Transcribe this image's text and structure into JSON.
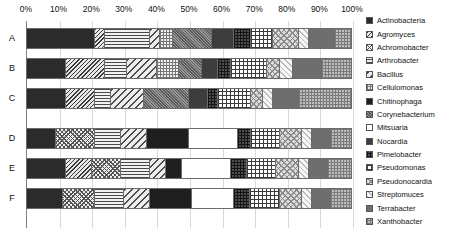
{
  "chart_data": {
    "type": "bar",
    "orientation": "horizontal",
    "stacked": true,
    "normalized_percent": true,
    "title": "",
    "xlabel": "",
    "ylabel": "",
    "xlim": [
      0,
      100
    ],
    "grid": true,
    "legend_position": "right",
    "categories": [
      "A",
      "B",
      "C",
      "D",
      "E",
      "F"
    ],
    "xtick_labels": [
      "0%",
      "10%",
      "20%",
      "30%",
      "40%",
      "50%",
      "60%",
      "70%",
      "80%",
      "90%",
      "100%"
    ],
    "xtick_values": [
      0,
      10,
      20,
      30,
      40,
      50,
      60,
      70,
      80,
      90,
      100
    ],
    "series": [
      {
        "name": "Actinobacteria",
        "pattern": "solid-dark",
        "values": [
          21,
          12,
          12,
          9,
          12,
          11
        ]
      },
      {
        "name": "Agromyces",
        "pattern": "diagonal-dense",
        "values": [
          3,
          12,
          9,
          0,
          8,
          0
        ]
      },
      {
        "name": "Achromobacter",
        "pattern": "crosshatch-checker",
        "values": [
          0,
          0,
          0,
          12,
          9,
          10
        ]
      },
      {
        "name": "Arthrobacter",
        "pattern": "horizontal-lines",
        "values": [
          14,
          7,
          5,
          8,
          9,
          9
        ]
      },
      {
        "name": "Bacillus",
        "pattern": "diagonal-wide",
        "values": [
          3,
          9,
          10,
          8,
          5,
          8
        ]
      },
      {
        "name": "Cellulomonas",
        "pattern": "fine-dots",
        "values": [
          4,
          7,
          0,
          0,
          0,
          0
        ]
      },
      {
        "name": "Chitinophaga",
        "pattern": "solid-black",
        "values": [
          0,
          0,
          0,
          13,
          5,
          13
        ]
      },
      {
        "name": "Corynebacterium",
        "pattern": "grey-stipple",
        "values": [
          12,
          7,
          14,
          0,
          0,
          0
        ]
      },
      {
        "name": "Mitsuaria",
        "pattern": "white",
        "values": [
          0,
          0,
          0,
          15,
          15,
          13
        ]
      },
      {
        "name": "Nocardia",
        "pattern": "solid-dark-grey",
        "values": [
          7,
          5,
          6,
          0,
          0,
          0
        ]
      },
      {
        "name": "Pimelobacter",
        "pattern": "dark-crosshatch",
        "values": [
          5,
          4,
          3,
          4,
          5,
          5
        ]
      },
      {
        "name": "Pseudomonas",
        "pattern": "grid-lines",
        "values": [
          7,
          11,
          10,
          9,
          9,
          9
        ]
      },
      {
        "name": "Pseudonocardia",
        "pattern": "light-stipple",
        "values": [
          8,
          4,
          4,
          7,
          7,
          7
        ]
      },
      {
        "name": "Streptomuces",
        "pattern": "very-light-dots",
        "values": [
          3,
          4,
          3,
          3,
          3,
          3
        ]
      },
      {
        "name": "Terrabacter",
        "pattern": "mid-grey-solid",
        "values": [
          8,
          9,
          8,
          6,
          6,
          6
        ]
      },
      {
        "name": "Xanthobacter",
        "pattern": "light-checker",
        "values": [
          5,
          9,
          16,
          6,
          7,
          6
        ]
      }
    ]
  },
  "axis": {
    "ticks": [
      "0%",
      "10%",
      "20%",
      "30%",
      "40%",
      "50%",
      "60%",
      "70%",
      "80%",
      "90%",
      "100%"
    ]
  },
  "rows": [
    {
      "label": "A"
    },
    {
      "label": "B"
    },
    {
      "label": "C"
    },
    {
      "label": "D"
    },
    {
      "label": "E"
    },
    {
      "label": "F"
    }
  ],
  "legend": {
    "items": [
      {
        "label": "Actinobacteria"
      },
      {
        "label": "Agromyces"
      },
      {
        "label": "Achromobacter"
      },
      {
        "label": "Arthrobacter"
      },
      {
        "label": "Bacillus"
      },
      {
        "label": "Cellulomonas"
      },
      {
        "label": "Chitinophaga"
      },
      {
        "label": "Corynebacterium"
      },
      {
        "label": "Mitsuaria"
      },
      {
        "label": "Nocardia"
      },
      {
        "label": "Pimelobacter"
      },
      {
        "label": "Pseudomonas"
      },
      {
        "label": "Pseudonocardia"
      },
      {
        "label": "Streptomuces"
      },
      {
        "label": "Terrabacter"
      },
      {
        "label": "Xanthobacter"
      }
    ]
  }
}
